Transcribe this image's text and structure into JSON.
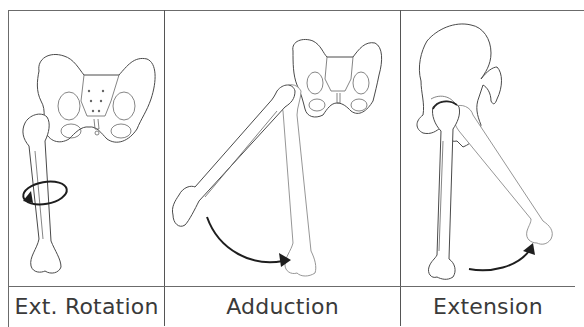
{
  "figure": {
    "panels": [
      {
        "id": "ext-rotation",
        "label": "Ext. Rotation",
        "motion": "rotation-arrow"
      },
      {
        "id": "adduction",
        "label": "Adduction",
        "motion": "curved-arrow"
      },
      {
        "id": "extension",
        "label": "Extension",
        "motion": "curved-arrow"
      }
    ],
    "colors": {
      "line": "#4a4a4a",
      "border": "#6b6b6b",
      "arrow": "#1e1e1e",
      "text": "#3a3a3a",
      "background": "#ffffff"
    }
  }
}
